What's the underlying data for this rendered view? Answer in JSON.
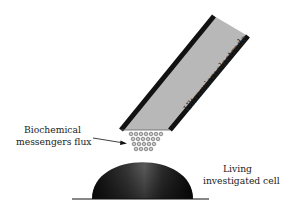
{
  "figure": {
    "type": "schematic",
    "labels": {
      "electrode": "Ultramicroelectrode",
      "flux_line1": "Biochemical",
      "flux_line2": "messengers flux",
      "cell_line1": "Living",
      "cell_line2": "investigated cell"
    },
    "colors": {
      "electrode_fill": "#b8b8b8",
      "electrode_border": "#111111",
      "cell_dark": "#1a1a1a",
      "cell_highlight": "#6a6a6a",
      "molecule_fill": "#c8c8c8",
      "molecule_stroke": "#555555",
      "baseline": "#111111"
    }
  }
}
